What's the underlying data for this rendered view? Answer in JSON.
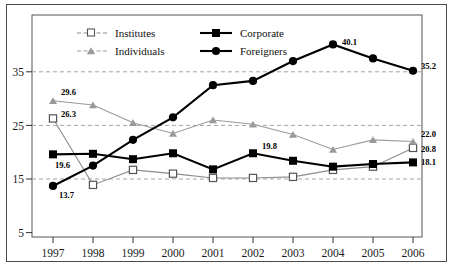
{
  "chart_data": {
    "type": "line",
    "title": "",
    "subtitle": "",
    "xlabel": "",
    "ylabel": "",
    "categories": [
      "1997",
      "1998",
      "1999",
      "2000",
      "2001",
      "2002",
      "2003",
      "2004",
      "2005",
      "2006"
    ],
    "xtick_labels": [
      "1997",
      "1998",
      "1999",
      "2000",
      "2001",
      "2002",
      "2003",
      "2004",
      "2005",
      "2006"
    ],
    "ytick_labels": [
      "35",
      "25",
      "15",
      "5"
    ],
    "yticks": [
      35,
      25,
      15,
      5
    ],
    "ylim": [
      5,
      45
    ],
    "grid": "horizontal-dashed",
    "legend_position": "top-inside",
    "series": [
      {
        "name": "Institutes",
        "marker": "open-square",
        "color": "#8c8c8c",
        "line_style": "solid-thin",
        "values": [
          26.3,
          13.9,
          16.7,
          16.0,
          15.2,
          15.2,
          15.4,
          16.7,
          17.3,
          20.8
        ]
      },
      {
        "name": "Corporate",
        "marker": "filled-square",
        "color": "#000000",
        "line_style": "solid-thick",
        "values": [
          19.6,
          19.7,
          18.7,
          19.8,
          16.8,
          19.8,
          18.4,
          17.3,
          17.8,
          18.1
        ]
      },
      {
        "name": "Individuals",
        "marker": "filled-triangle",
        "color": "#9a9a9a",
        "line_style": "solid-thin",
        "values": [
          29.6,
          28.8,
          25.5,
          23.5,
          26.0,
          25.2,
          23.3,
          20.5,
          22.3,
          22.0
        ]
      },
      {
        "name": "Foreigners",
        "marker": "filled-circle",
        "color": "#000000",
        "line_style": "solid-thick",
        "values": [
          13.7,
          17.5,
          22.3,
          26.5,
          32.5,
          33.3,
          37.0,
          40.1,
          37.5,
          35.2
        ]
      }
    ],
    "annotations": [
      {
        "text": "29.6",
        "series": "Individuals",
        "category": "1997"
      },
      {
        "text": "26.3",
        "series": "Institutes",
        "category": "1997"
      },
      {
        "text": "19.6",
        "series": "Corporate",
        "category": "1997"
      },
      {
        "text": "13.7",
        "series": "Foreigners",
        "category": "1997"
      },
      {
        "text": "19.8",
        "series": "Corporate",
        "category": "2002"
      },
      {
        "text": "40.1",
        "series": "Foreigners",
        "category": "2004"
      },
      {
        "text": "35.2",
        "series": "Foreigners",
        "category": "2006"
      },
      {
        "text": "22.0",
        "series": "Individuals",
        "category": "2006"
      },
      {
        "text": "20.8",
        "series": "Institutes",
        "category": "2006"
      },
      {
        "text": "18.1",
        "series": "Corporate",
        "category": "2006"
      }
    ]
  },
  "legend": {
    "items": [
      {
        "label": "Institutes"
      },
      {
        "label": "Corporate"
      },
      {
        "label": "Individuals"
      },
      {
        "label": "Foreigners"
      }
    ]
  },
  "colors": {
    "gray_series": "#8c8c8c",
    "black_series": "#000000",
    "gridline": "#9b9b9b",
    "frame": "#4a4a4a",
    "background": "#ffffff"
  }
}
